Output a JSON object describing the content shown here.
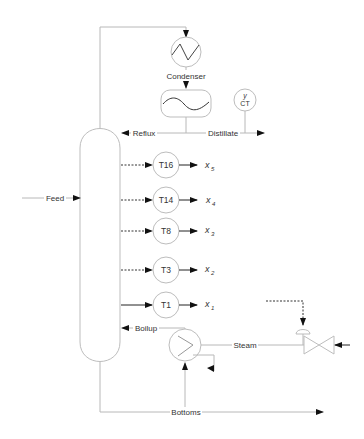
{
  "diagram": {
    "type": "distillation-column-schematic",
    "units": {
      "condenser": "Condenser",
      "composition_transmitter_top": "y",
      "composition_transmitter_label": "CT"
    },
    "streams": {
      "feed": "Feed",
      "reflux": "Reflux",
      "distillate": "Distillate",
      "boilup": "Boilup",
      "steam": "Steam",
      "bottoms": "Bottoms"
    },
    "temperature_sensors": [
      {
        "tag": "T16",
        "output": "x",
        "sub": "5"
      },
      {
        "tag": "T14",
        "output": "x",
        "sub": "4"
      },
      {
        "tag": "T8",
        "output": "x",
        "sub": "3"
      },
      {
        "tag": "T3",
        "output": "x",
        "sub": "2"
      },
      {
        "tag": "T1",
        "output": "x",
        "sub": "1"
      }
    ]
  }
}
